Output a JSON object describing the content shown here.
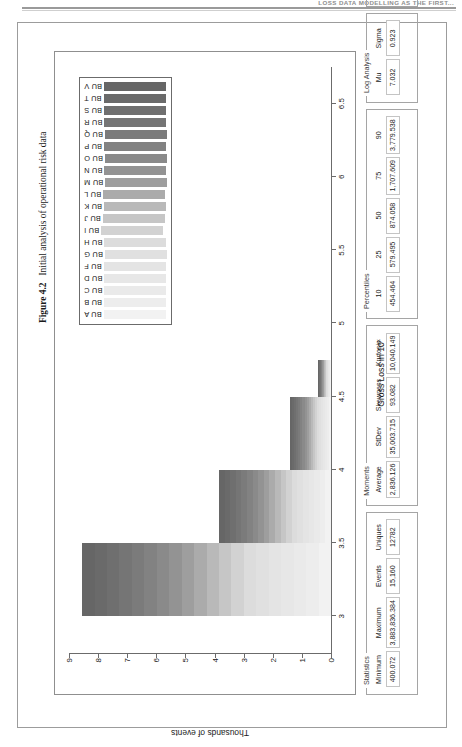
{
  "page": {
    "running_head": "LOSS DATA MODELLING AS THE FIRST..."
  },
  "caption": {
    "label": "Figure 4.2",
    "text": "Initial analysis of operational risk data"
  },
  "chart_data": {
    "type": "bar",
    "title": "",
    "xlabel": "Gross Loss in 10",
    "xlabel_exponent": "x",
    "ylabel": "Thousands of events",
    "x_ticks": [
      "3",
      "3.5",
      "4",
      "4.5",
      "5",
      "5.5",
      "6",
      "6.5"
    ],
    "xlim": [
      2.75,
      6.75
    ],
    "y_ticks": [
      "0",
      "1",
      "2",
      "3",
      "4",
      "5",
      "6",
      "7",
      "8",
      "9"
    ],
    "ylim": [
      0,
      9
    ],
    "grid": false,
    "legend_position": "top-right",
    "legend": [
      "BU A",
      "BU B",
      "BU C",
      "BU D",
      "BU F",
      "BU G",
      "BU H",
      "BU I",
      "BU J",
      "BU K",
      "BU L",
      "BU M",
      "BU N",
      "BU O",
      "BU P",
      "BU Q",
      "BU R",
      "BU S",
      "BU T",
      "BU V"
    ],
    "legend_colors": [
      "#f2f2f2",
      "#ededed",
      "#eaeaea",
      "#e7e7e7",
      "#e4e4e4",
      "#e0e0e0",
      "#dcdcdc",
      "#d2d2d2",
      "#c6c6c6",
      "#b9b9b9",
      "#ababab",
      "#9e9e9e",
      "#939393",
      "#8a8a8a",
      "#828282",
      "#7b7b7b",
      "#757575",
      "#6f6f6f",
      "#6a6a6a",
      "#666666"
    ],
    "categories": [
      "3",
      "3.5",
      "4",
      "4.5"
    ],
    "values": [
      8.55,
      3.85,
      1.4,
      0.45
    ],
    "bars": [
      {
        "x_start": "3",
        "x_end": "3.5",
        "height": 8.55
      },
      {
        "x_start": "3.5",
        "x_end": "4",
        "height": 3.85
      },
      {
        "x_start": "4",
        "x_end": "4.5",
        "height": 1.4
      },
      {
        "x_start": "4.5",
        "x_end": "4.75",
        "height": 0.45
      }
    ]
  },
  "stats": {
    "groups": [
      {
        "title": "Statistics",
        "rows": [
          {
            "label": "Minimum",
            "value": "400.072"
          },
          {
            "label": "Maximum",
            "value": "3,883,836.384"
          },
          {
            "label": "Events",
            "value": "15,160"
          },
          {
            "label": "Uniques",
            "value": "12782"
          }
        ]
      },
      {
        "title": "Moments",
        "rows": [
          {
            "label": "Average",
            "value": "2,836.126"
          },
          {
            "label": "StDev",
            "value": "35,003.715"
          },
          {
            "label": "Skewness",
            "value": "93.082"
          },
          {
            "label": "Kurtosis",
            "value": "10,040.149"
          }
        ]
      },
      {
        "title": "Percentiles",
        "rows": [
          {
            "label": "10",
            "value": "454.464"
          },
          {
            "label": "25",
            "value": "579.495"
          },
          {
            "label": "50",
            "value": "874.058"
          },
          {
            "label": "75",
            "value": "1,707.609"
          },
          {
            "label": "90",
            "value": "3,779.538"
          }
        ]
      },
      {
        "title": "Log Analysis",
        "rows": [
          {
            "label": "Mu",
            "value": "7.032"
          },
          {
            "label": "Sigma",
            "value": "0.923"
          }
        ]
      },
      {
        "title": "Histogram",
        "rows": [
          {
            "label": "Amount",
            "value": "187844.364"
          },
          {
            "label": "CDF",
            "value": "0.999"
          }
        ]
      }
    ]
  },
  "colors": {
    "rule": "#9a9a9a",
    "frame": "#9c9c9c",
    "axis": "#6b6b6b"
  }
}
